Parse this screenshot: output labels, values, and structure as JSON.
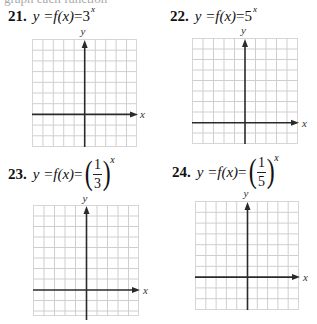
{
  "cutoff_line": "graph each function",
  "problems": [
    {
      "number": "21.",
      "lhs": "y = ",
      "fn": "f(x)",
      "eq": " = ",
      "base": "3",
      "exponent": "x",
      "form": "power",
      "axis_labels": {
        "x": "x",
        "y": "y"
      },
      "grid": {
        "cols": 10,
        "rows": 10,
        "yaxis_col": 5,
        "xaxis_row": 7
      }
    },
    {
      "number": "22.",
      "lhs": "y = ",
      "fn": "f(x)",
      "eq": " = ",
      "base": "5",
      "exponent": "x",
      "form": "power",
      "axis_labels": {
        "x": "x",
        "y": "y"
      },
      "grid": {
        "cols": 10,
        "rows": 10,
        "yaxis_col": 5,
        "xaxis_row": 8
      }
    },
    {
      "number": "23.",
      "lhs": "y = ",
      "fn": "f(x)",
      "eq": " = ",
      "numerator": "1",
      "denominator": "3",
      "exponent": "x",
      "form": "fraction",
      "axis_labels": {
        "x": "x",
        "y": "y"
      },
      "grid": {
        "cols": 10,
        "rows": 10,
        "yaxis_col": 5,
        "xaxis_row": 8
      }
    },
    {
      "number": "24.",
      "lhs": "y = ",
      "fn": "f(x)",
      "eq": " = ",
      "numerator": "1",
      "denominator": "5",
      "exponent": "x",
      "form": "fraction",
      "axis_labels": {
        "x": "x",
        "y": "y"
      },
      "grid": {
        "cols": 10,
        "rows": 10,
        "yaxis_col": 5,
        "xaxis_row": 7
      }
    }
  ],
  "colors": {
    "grid": "#cfcfcf",
    "axis": "#2a2a2a",
    "text": "#111111"
  }
}
